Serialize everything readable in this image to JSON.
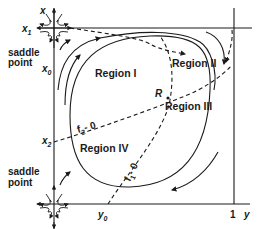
{
  "diagram": {
    "axes": {
      "vertical_left_label": "x",
      "horizontal_label": "y",
      "right_tick_label": "1"
    },
    "x_labels": {
      "x1": {
        "base": "x",
        "sub": "1"
      },
      "x0": {
        "base": "x",
        "sub": "0"
      },
      "x2": {
        "base": "x",
        "sub": "2"
      }
    },
    "y_labels": {
      "y0": {
        "base": "y",
        "sub": "0"
      }
    },
    "saddle_top": {
      "line1": "saddle",
      "line2": "point"
    },
    "saddle_bottom": {
      "line1": "saddle",
      "line2": "point"
    },
    "regions": [
      "Region I",
      "Region II",
      "Region III",
      "Region IV"
    ],
    "point_R": "R",
    "nullclines": {
      "f2": {
        "base": "f",
        "sub": "2",
        "eq": "- 0"
      },
      "f1": {
        "base": "f",
        "sub": "1",
        "eq": "- 0"
      }
    },
    "colors": {
      "ink": "#1a1a1a",
      "background": "#ffffff"
    }
  }
}
